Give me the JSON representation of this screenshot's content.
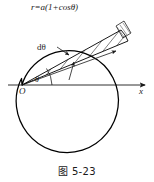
{
  "figure": {
    "caption": "图 5-23",
    "curve_equation": {
      "lhs": "r",
      "eq": "=",
      "coef": "a",
      "open": "(1+cos",
      "theta": "θ",
      "close": ")",
      "full": "r=a(1+cosθ)"
    },
    "labels": {
      "differential_angle": "dθ",
      "angle": "θ",
      "origin": "O",
      "x_axis": "x"
    },
    "colors": {
      "background": "#ffffff",
      "ink": "#1a1a1a",
      "curve": "#000000",
      "hatch": "#333333"
    },
    "geometry": {
      "type": "cardioid",
      "polar_equation": "r=a(1+cosθ)",
      "origin_px": [
        22,
        85
      ],
      "axis_y_px": 85,
      "axis_x_start_px": 8,
      "axis_x_end_px": 148,
      "scale_a_px": 42,
      "sector_theta_deg": 38,
      "sector_dtheta_deg": 6
    }
  }
}
